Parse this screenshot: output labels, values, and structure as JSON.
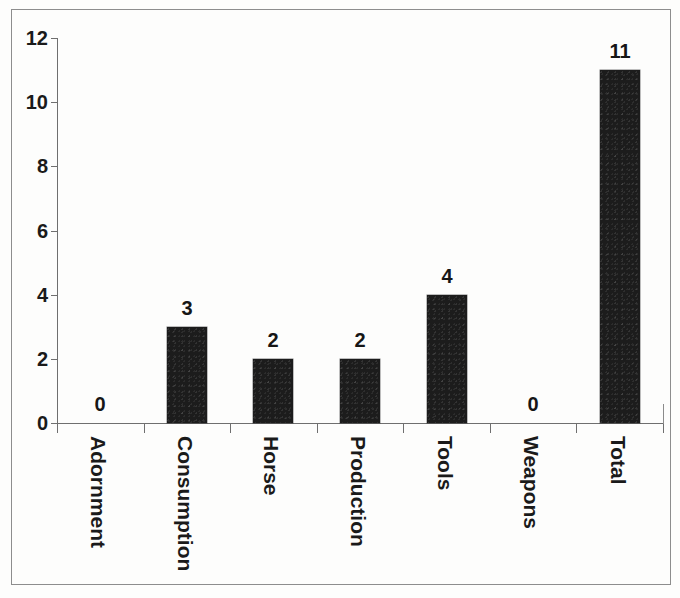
{
  "chart_data": {
    "type": "bar",
    "title": "",
    "subtitle": "",
    "xlabel": "",
    "ylabel": "",
    "categories": [
      "Adornment",
      "Consumption",
      "Horse",
      "Production",
      "Tools",
      "Weapons",
      "Total"
    ],
    "values": [
      0,
      3,
      2,
      2,
      4,
      0,
      11
    ],
    "value_labels": [
      "0",
      "3",
      "2",
      "2",
      "4",
      "0",
      "11"
    ],
    "ylim": [
      0,
      12
    ],
    "ytick_labels": [
      "0",
      "2",
      "4",
      "6",
      "8",
      "10",
      "12"
    ],
    "ytick_values": [
      0,
      2,
      4,
      6,
      8,
      10,
      12
    ],
    "grid": false,
    "legend": null,
    "legend_position": "none",
    "bar_color": "#1c1c1c",
    "axis_color": "#6f6f6f",
    "text_color": "#1a1a1a",
    "background_color": "#ffffff",
    "xtick_label_rotation": 90,
    "series": [
      {
        "name": "count",
        "values": [
          0,
          3,
          2,
          2,
          4,
          0,
          11
        ]
      }
    ]
  }
}
